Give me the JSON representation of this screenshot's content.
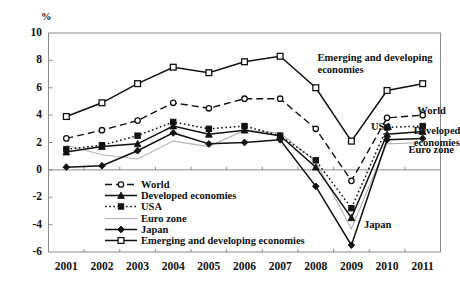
{
  "chart_data": {
    "type": "line",
    "title": "",
    "subtitle": "",
    "xlabel": "",
    "ylabel": "%",
    "unit_label": "%",
    "grid": false,
    "legend_position": "inside-bottom-left",
    "categories": [
      "2001",
      "2002",
      "2003",
      "2004",
      "2005",
      "2006",
      "2007",
      "2008",
      "2009",
      "2010",
      "2011"
    ],
    "x": [
      2001,
      2002,
      2003,
      2004,
      2005,
      2006,
      2007,
      2008,
      2009,
      2010,
      2011
    ],
    "ylim": [
      -6,
      10
    ],
    "yticks": [
      -6,
      -4,
      -2,
      0,
      2,
      4,
      6,
      8,
      10
    ],
    "ytick_labels": [
      "-6",
      "-4",
      "-2",
      "0",
      "2",
      "4",
      "6",
      "8",
      "10"
    ],
    "series": [
      {
        "name": "World",
        "marker": "circle-open",
        "line": "dashed",
        "color": "#111111",
        "values": [
          2.3,
          2.9,
          3.6,
          4.9,
          4.5,
          5.2,
          5.2,
          3.0,
          -0.8,
          3.8,
          4.0
        ]
      },
      {
        "name": "Developed economies",
        "marker": "triangle-filled",
        "line": "solid",
        "color": "#111111",
        "values": [
          1.3,
          1.7,
          1.9,
          3.2,
          2.6,
          2.9,
          2.5,
          0.2,
          -3.5,
          2.6,
          2.8
        ]
      },
      {
        "name": "USA",
        "marker": "square-filled",
        "line": "dotted",
        "color": "#111111",
        "values": [
          1.5,
          1.8,
          2.5,
          3.5,
          3.0,
          3.2,
          2.5,
          0.7,
          -2.8,
          3.1,
          3.2
        ]
      },
      {
        "name": "Euro zone",
        "marker": "none",
        "line": "solid-light",
        "color": "#b3b3b3",
        "values": [
          1.8,
          1.1,
          0.8,
          2.1,
          1.7,
          2.9,
          2.7,
          0.6,
          -4.3,
          1.9,
          2.0
        ]
      },
      {
        "name": "Japan",
        "marker": "diamond-filled",
        "line": "solid",
        "color": "#111111",
        "values": [
          0.2,
          0.3,
          1.4,
          2.7,
          1.9,
          2.0,
          2.2,
          -1.2,
          -5.5,
          2.2,
          2.3
        ]
      },
      {
        "name": "Emerging and developing economies",
        "marker": "square-open",
        "line": "solid",
        "color": "#111111",
        "values": [
          3.9,
          4.9,
          6.3,
          7.5,
          7.1,
          7.9,
          8.3,
          6.0,
          2.1,
          5.8,
          6.3
        ]
      }
    ],
    "annotations": [
      {
        "text": "Emerging and developing",
        "text2": "economies",
        "x": 2008.05,
        "y": 8.15
      },
      {
        "text": "World",
        "x": 2010.85,
        "y": 4.3
      },
      {
        "text": "USA",
        "x": 2009.55,
        "y": 3.1
      },
      {
        "text": "Developed",
        "text2": "economies",
        "x": 2010.75,
        "y": 2.85
      },
      {
        "text": "Euro zone",
        "x": 2010.6,
        "y": 1.45
      },
      {
        "text": "Japan",
        "x": 2009.35,
        "y": -4.05
      }
    ]
  },
  "legend": {
    "items": [
      {
        "label": "World"
      },
      {
        "label": "Developed economies"
      },
      {
        "label": "USA"
      },
      {
        "label": "Euro zone"
      },
      {
        "label": "Japan"
      },
      {
        "label": "Emerging and developing economies"
      }
    ]
  }
}
